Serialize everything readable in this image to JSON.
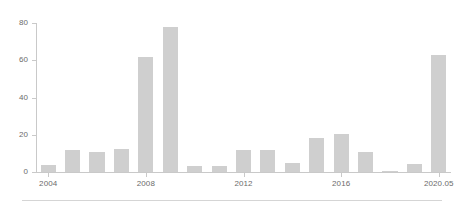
{
  "chart_data": {
    "type": "bar",
    "title": "",
    "subtitle": "",
    "xlabel": "",
    "ylabel": "",
    "categories": [
      "2004",
      "2005",
      "2006",
      "2007",
      "2008",
      "2009",
      "2010",
      "2011",
      "2012",
      "2013",
      "2014",
      "2015",
      "2016",
      "2017",
      "2018",
      "2019",
      "2020.05"
    ],
    "values": [
      3.5,
      12,
      10.5,
      12.5,
      62,
      78,
      3,
      3,
      12,
      12,
      5,
      18.5,
      20.5,
      11,
      0.7,
      4.5,
      63
    ],
    "x_tick_labels": [
      "2004",
      "2008",
      "2012",
      "2016",
      "2020.05"
    ],
    "x_tick_categories": [
      "2004",
      "2008",
      "2012",
      "2016",
      "2020.05"
    ],
    "y_tick_labels": [
      "0",
      "20",
      "40",
      "60",
      "80"
    ],
    "y_tick_values": [
      0,
      20,
      40,
      60,
      80
    ],
    "ylim": [
      0,
      80
    ],
    "grid": false,
    "legend": null,
    "legend_position": "none",
    "bar_color": "#cfcfcf",
    "axis_color": "#c9c9c9",
    "tick_label_color": "#6b6b6b",
    "background_color": "#ffffff"
  }
}
